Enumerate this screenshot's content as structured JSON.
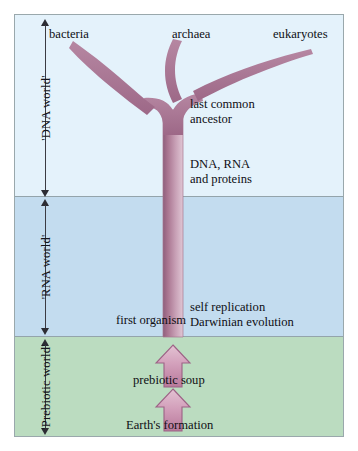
{
  "diagram": {
    "bands": [
      {
        "id": "dna",
        "label": "'DNA world'",
        "color": "#e4f2fb"
      },
      {
        "id": "rna",
        "label": "'RNA world'",
        "color": "#c3dcef"
      },
      {
        "id": "prebiotic",
        "label": "'Prebiotic world'",
        "color": "#bbdcc0"
      }
    ],
    "tree": {
      "branch_color": "#a87090",
      "branch_color_light": "#d9b8c9",
      "tips": [
        {
          "name": "bacteria",
          "label": "bacteria"
        },
        {
          "name": "archaea",
          "label": "archaea"
        },
        {
          "name": "eukaryotes",
          "label": "eukaryotes"
        }
      ],
      "node_label": "last common\nancestor"
    },
    "annotations": [
      {
        "id": "lca",
        "text": "last common\nancestor"
      },
      {
        "id": "molecules",
        "text": "DNA, RNA\nand proteins"
      },
      {
        "id": "first_organism",
        "text": "first organism"
      },
      {
        "id": "self_rep",
        "text": "self replication\nDarwinian evolution"
      },
      {
        "id": "soup",
        "text": "prebiotic soup"
      },
      {
        "id": "earth",
        "text": "Earth's formation"
      }
    ],
    "arrows": [
      {
        "id": "soup_arrow",
        "direction": "up",
        "color": "#c98fae"
      },
      {
        "id": "earth_arrow",
        "direction": "up",
        "color": "#c98fae"
      }
    ]
  }
}
